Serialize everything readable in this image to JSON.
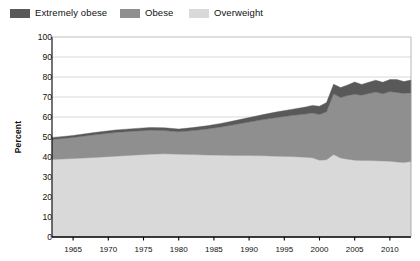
{
  "legend": {
    "position": "top-left",
    "items": [
      {
        "label": "Extremely obese",
        "color": "#595959",
        "swatch_name": "legend-swatch-extremely-obese"
      },
      {
        "label": "Obese",
        "color": "#8f8f8f",
        "swatch_name": "legend-swatch-obese"
      },
      {
        "label": "Overweight",
        "color": "#d9d9d9",
        "swatch_name": "legend-swatch-overweight"
      }
    ]
  },
  "axes": {
    "ylabel": "Percent",
    "yticks": [
      "100",
      "90",
      "80",
      "70",
      "60",
      "50",
      "40",
      "30",
      "20",
      "10",
      "0"
    ],
    "xticks": [
      "1965",
      "1970",
      "1975",
      "1980",
      "1985",
      "1990",
      "1995",
      "2000",
      "2005",
      "2010"
    ]
  },
  "chart_data": {
    "type": "area",
    "stacked": true,
    "title": "",
    "subtitle": "",
    "xlabel": "",
    "ylabel": "Percent",
    "ylim": [
      0,
      100
    ],
    "xlim": [
      1962,
      2013
    ],
    "grid": true,
    "grid_axis": "y",
    "legend_position": "top-left",
    "annotations": [],
    "x": [
      1962,
      1965,
      1968,
      1971,
      1974,
      1976,
      1978,
      1980,
      1982,
      1984,
      1986,
      1988,
      1990,
      1992,
      1994,
      1996,
      1998,
      1999,
      2000,
      2001,
      2002,
      2003,
      2004,
      2005,
      2006,
      2007,
      2008,
      2009,
      2010,
      2011,
      2012,
      2013
    ],
    "series": [
      {
        "name": "Overweight",
        "color": "#d9d9d9",
        "values": [
          38.8,
          39.2,
          39.8,
          40.4,
          41.0,
          41.4,
          41.6,
          41.4,
          41.2,
          41.0,
          40.9,
          40.8,
          40.7,
          40.6,
          40.4,
          40.2,
          39.9,
          39.6,
          38.4,
          38.6,
          41.2,
          39.5,
          38.9,
          38.4,
          38.3,
          38.2,
          38.1,
          38.0,
          37.9,
          37.5,
          37.2,
          37.8
        ]
      },
      {
        "name": "Obese",
        "color": "#8f8f8f",
        "values": [
          9.9,
          10.6,
          11.3,
          11.9,
          12.0,
          12.0,
          11.6,
          11.2,
          12.0,
          13.0,
          14.1,
          15.4,
          16.8,
          18.1,
          19.4,
          20.5,
          21.6,
          22.4,
          22.8,
          24.0,
          30.4,
          30.2,
          31.8,
          33.0,
          32.6,
          33.5,
          34.4,
          33.6,
          34.8,
          34.8,
          34.6,
          34.2
        ]
      },
      {
        "name": "Extremely obese",
        "color": "#595959",
        "values": [
          0.9,
          1.0,
          1.1,
          1.2,
          1.3,
          1.4,
          1.4,
          1.4,
          1.5,
          1.6,
          1.8,
          2.0,
          2.2,
          2.5,
          2.8,
          3.1,
          3.5,
          3.8,
          4.2,
          4.6,
          4.8,
          5.0,
          5.3,
          6.1,
          5.4,
          5.7,
          5.9,
          5.8,
          6.0,
          6.4,
          5.9,
          6.5
        ]
      }
    ],
    "totals": [
      49.6,
      50.8,
      52.2,
      53.5,
      54.3,
      54.8,
      54.6,
      54.0,
      54.7,
      55.6,
      56.8,
      58.2,
      59.7,
      61.2,
      62.6,
      63.8,
      65.0,
      65.8,
      65.4,
      67.2,
      76.4,
      74.7,
      76.0,
      77.5,
      76.3,
      77.4,
      78.4,
      77.4,
      78.7,
      78.7,
      77.7,
      78.5
    ]
  }
}
